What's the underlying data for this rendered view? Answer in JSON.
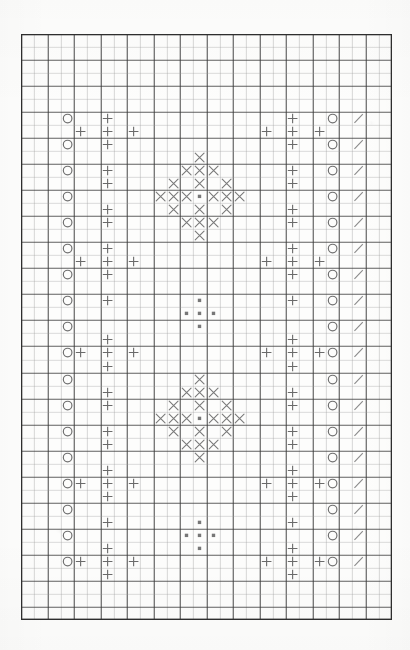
{
  "document": {
    "kind": "cross-stitch-pattern-chart",
    "title": "Cross-Stitch Pattern Chart",
    "background_color": "#fdfdfc"
  },
  "grid": {
    "columns": 28,
    "rows": 45,
    "cell_width": 13.25,
    "cell_height": 13.02,
    "origin_x": 21,
    "origin_y": 34,
    "minor_line_color": "#9a9a9a",
    "major_line_color": "#3a3a3a",
    "border_color": "#2e2e2e",
    "major_every": 2,
    "minor_line_width": 0.7,
    "major_line_width": 1.1,
    "border_line_width": 1.6
  },
  "legend": {
    "symbols": [
      {
        "key": "circle",
        "name": "circle-symbol",
        "label": "O",
        "color": "#6e6e6e"
      },
      {
        "key": "plus",
        "name": "plus-symbol",
        "label": "+",
        "color": "#6a6a6a"
      },
      {
        "key": "cross",
        "name": "cross-symbol",
        "label": "X",
        "color": "#7a7a7a"
      },
      {
        "key": "dot",
        "name": "dot-symbol",
        "label": "▪",
        "color": "#777777"
      },
      {
        "key": "slash",
        "name": "slash-symbol",
        "label": "/",
        "color": "#8a8a8a"
      }
    ]
  },
  "stitches": {
    "circle": [
      [
        3,
        6
      ],
      [
        3,
        8
      ],
      [
        3,
        10
      ],
      [
        3,
        12
      ],
      [
        3,
        14
      ],
      [
        3,
        16
      ],
      [
        3,
        18
      ],
      [
        3,
        20
      ],
      [
        3,
        22
      ],
      [
        3,
        24
      ],
      [
        3,
        26
      ],
      [
        3,
        28
      ],
      [
        3,
        30
      ],
      [
        3,
        32
      ],
      [
        3,
        34
      ],
      [
        3,
        36
      ],
      [
        3,
        38
      ],
      [
        3,
        40
      ],
      [
        23,
        6
      ],
      [
        23,
        8
      ],
      [
        23,
        10
      ],
      [
        23,
        12
      ],
      [
        23,
        14
      ],
      [
        23,
        16
      ],
      [
        23,
        18
      ],
      [
        23,
        20
      ],
      [
        23,
        22
      ],
      [
        23,
        24
      ],
      [
        23,
        26
      ],
      [
        23,
        28
      ],
      [
        23,
        30
      ],
      [
        23,
        32
      ],
      [
        23,
        34
      ],
      [
        23,
        36
      ],
      [
        23,
        38
      ],
      [
        23,
        40
      ]
    ],
    "slash": [
      [
        25,
        6
      ],
      [
        25,
        8
      ],
      [
        25,
        10
      ],
      [
        25,
        12
      ],
      [
        25,
        14
      ],
      [
        25,
        16
      ],
      [
        25,
        18
      ],
      [
        25,
        20
      ],
      [
        25,
        22
      ],
      [
        25,
        24
      ],
      [
        25,
        26
      ],
      [
        25,
        28
      ],
      [
        25,
        30
      ],
      [
        25,
        32
      ],
      [
        25,
        34
      ],
      [
        25,
        36
      ],
      [
        25,
        38
      ],
      [
        25,
        40
      ]
    ],
    "plus": [
      [
        6,
        6
      ],
      [
        4,
        7
      ],
      [
        6,
        7
      ],
      [
        8,
        7
      ],
      [
        6,
        8
      ],
      [
        6,
        10
      ],
      [
        6,
        11
      ],
      [
        6,
        13
      ],
      [
        6,
        14
      ],
      [
        6,
        16
      ],
      [
        4,
        17
      ],
      [
        6,
        17
      ],
      [
        8,
        17
      ],
      [
        6,
        18
      ],
      [
        6,
        20
      ],
      [
        6,
        23
      ],
      [
        4,
        24
      ],
      [
        6,
        24
      ],
      [
        8,
        24
      ],
      [
        6,
        25
      ],
      [
        6,
        27
      ],
      [
        6,
        28
      ],
      [
        6,
        30
      ],
      [
        6,
        31
      ],
      [
        6,
        33
      ],
      [
        4,
        34
      ],
      [
        6,
        34
      ],
      [
        8,
        34
      ],
      [
        6,
        35
      ],
      [
        6,
        37
      ],
      [
        6,
        39
      ],
      [
        4,
        40
      ],
      [
        6,
        40
      ],
      [
        8,
        40
      ],
      [
        6,
        41
      ],
      [
        20,
        6
      ],
      [
        18,
        7
      ],
      [
        20,
        7
      ],
      [
        22,
        7
      ],
      [
        20,
        8
      ],
      [
        20,
        10
      ],
      [
        20,
        11
      ],
      [
        20,
        13
      ],
      [
        20,
        14
      ],
      [
        20,
        16
      ],
      [
        18,
        17
      ],
      [
        20,
        17
      ],
      [
        22,
        17
      ],
      [
        20,
        18
      ],
      [
        20,
        20
      ],
      [
        20,
        23
      ],
      [
        18,
        24
      ],
      [
        20,
        24
      ],
      [
        22,
        24
      ],
      [
        20,
        25
      ],
      [
        20,
        27
      ],
      [
        20,
        28
      ],
      [
        20,
        30
      ],
      [
        20,
        31
      ],
      [
        20,
        33
      ],
      [
        18,
        34
      ],
      [
        20,
        34
      ],
      [
        22,
        34
      ],
      [
        20,
        35
      ],
      [
        20,
        37
      ],
      [
        20,
        39
      ],
      [
        18,
        40
      ],
      [
        20,
        40
      ],
      [
        22,
        40
      ],
      [
        20,
        41
      ]
    ],
    "cross": [
      [
        13,
        9
      ],
      [
        12,
        10
      ],
      [
        13,
        10
      ],
      [
        14,
        10
      ],
      [
        11,
        11
      ],
      [
        13,
        11
      ],
      [
        15,
        11
      ],
      [
        10,
        12
      ],
      [
        11,
        12
      ],
      [
        12,
        12
      ],
      [
        14,
        12
      ],
      [
        15,
        12
      ],
      [
        16,
        12
      ],
      [
        11,
        13
      ],
      [
        13,
        13
      ],
      [
        15,
        13
      ],
      [
        12,
        14
      ],
      [
        13,
        14
      ],
      [
        14,
        14
      ],
      [
        13,
        15
      ],
      [
        13,
        26
      ],
      [
        12,
        27
      ],
      [
        13,
        27
      ],
      [
        14,
        27
      ],
      [
        11,
        28
      ],
      [
        13,
        28
      ],
      [
        15,
        28
      ],
      [
        10,
        29
      ],
      [
        11,
        29
      ],
      [
        12,
        29
      ],
      [
        14,
        29
      ],
      [
        15,
        29
      ],
      [
        16,
        29
      ],
      [
        11,
        30
      ],
      [
        13,
        30
      ],
      [
        15,
        30
      ],
      [
        12,
        31
      ],
      [
        13,
        31
      ],
      [
        14,
        31
      ],
      [
        13,
        32
      ]
    ],
    "dot": [
      [
        13,
        12
      ],
      [
        13,
        29
      ],
      [
        13,
        20
      ],
      [
        12,
        21
      ],
      [
        13,
        21
      ],
      [
        14,
        21
      ],
      [
        13,
        22
      ],
      [
        13,
        37
      ],
      [
        12,
        38
      ],
      [
        13,
        38
      ],
      [
        14,
        38
      ],
      [
        13,
        39
      ]
    ]
  },
  "marks": {
    "smudges": [
      {
        "x": 370,
        "y": 122,
        "w": 3,
        "h": 2
      },
      {
        "x": 58,
        "y": 530,
        "w": 4,
        "h": 2
      },
      {
        "x": 355,
        "y": 527,
        "w": 3,
        "h": 2
      }
    ]
  }
}
